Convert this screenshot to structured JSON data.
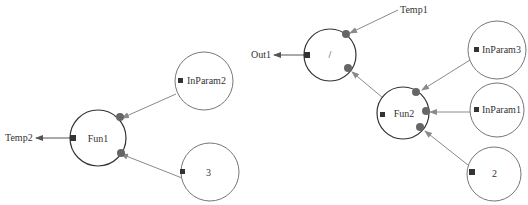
{
  "diagram": {
    "colors": {
      "background": "#ffffff",
      "function_stroke": "#333333",
      "param_stroke": "#777777",
      "edge": "#8a8a8a",
      "port_in": "#555555",
      "port_out": "#333333",
      "text": "#333333"
    },
    "nodes": [
      {
        "id": "fun1",
        "label": "Fun1",
        "kind": "function",
        "cx": 98,
        "cy": 138,
        "r": 28
      },
      {
        "id": "inparam2",
        "label": "InParam2",
        "kind": "param",
        "cx": 204,
        "cy": 81,
        "r": 29
      },
      {
        "id": "const3",
        "label": "3",
        "kind": "param",
        "cx": 210,
        "cy": 172,
        "r": 29
      },
      {
        "id": "div",
        "label": "/",
        "kind": "function",
        "cx": 330,
        "cy": 55,
        "r": 26
      },
      {
        "id": "fun2",
        "label": "Fun2",
        "kind": "function",
        "cx": 403,
        "cy": 113,
        "r": 26
      },
      {
        "id": "inparam3",
        "label": "InParam3",
        "kind": "param",
        "cx": 497,
        "cy": 50,
        "r": 29
      },
      {
        "id": "inparam1",
        "label": "InParam1",
        "kind": "param",
        "cx": 497,
        "cy": 110,
        "r": 27
      },
      {
        "id": "const2",
        "label": "2",
        "kind": "param",
        "cx": 494,
        "cy": 174,
        "r": 27
      }
    ],
    "outputs": [
      {
        "label": "Temp2",
        "x": 5,
        "y": 141
      },
      {
        "label": "Out1",
        "x": 277,
        "y": 58
      }
    ],
    "inputs_external": [
      {
        "label": "Temp1",
        "x": 400,
        "y": 13
      }
    ]
  }
}
